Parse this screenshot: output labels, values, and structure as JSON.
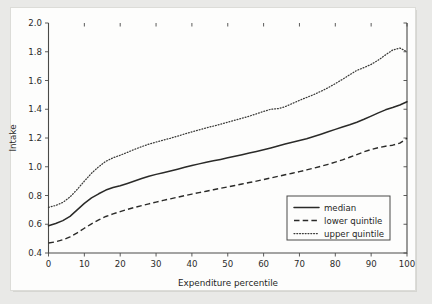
{
  "chart_data": {
    "type": "line",
    "title": "",
    "xlabel": "Expenditure percentile",
    "ylabel": "Intake",
    "xlim": [
      0,
      100
    ],
    "ylim": [
      0.4,
      2.0
    ],
    "grid": false,
    "legend_position": "bottom-right",
    "xticks": [
      "0",
      "10",
      "20",
      "30",
      "40",
      "50",
      "60",
      "70",
      "80",
      "90",
      "100"
    ],
    "xtick_values": [
      0,
      10,
      20,
      30,
      40,
      50,
      60,
      70,
      80,
      90,
      100
    ],
    "yticks": [
      "0.4",
      "0.6",
      "0.8",
      "1.0",
      "1.2",
      "1.4",
      "1.6",
      "1.8",
      "2.0"
    ],
    "ytick_values": [
      0.4,
      0.6,
      0.8,
      1.0,
      1.2,
      1.4,
      1.6,
      1.8,
      2.0
    ],
    "x": [
      0,
      2,
      4,
      6,
      8,
      10,
      12,
      14,
      16,
      18,
      20,
      22,
      24,
      26,
      28,
      30,
      32,
      34,
      36,
      38,
      40,
      42,
      44,
      46,
      48,
      50,
      52,
      54,
      56,
      58,
      60,
      62,
      64,
      66,
      68,
      70,
      72,
      74,
      76,
      78,
      80,
      82,
      84,
      86,
      88,
      90,
      92,
      94,
      96,
      98,
      100
    ],
    "series": [
      {
        "name": "median",
        "style": "solid",
        "values": [
          0.59,
          0.605,
          0.625,
          0.655,
          0.7,
          0.745,
          0.783,
          0.812,
          0.838,
          0.856,
          0.868,
          0.884,
          0.901,
          0.918,
          0.934,
          0.947,
          0.958,
          0.97,
          0.983,
          0.996,
          1.008,
          1.02,
          1.031,
          1.041,
          1.051,
          1.062,
          1.073,
          1.084,
          1.095,
          1.106,
          1.118,
          1.131,
          1.145,
          1.158,
          1.17,
          1.182,
          1.195,
          1.21,
          1.226,
          1.243,
          1.26,
          1.276,
          1.292,
          1.31,
          1.33,
          1.352,
          1.375,
          1.396,
          1.412,
          1.43,
          1.452
        ]
      },
      {
        "name": "lower quintile",
        "style": "dashed",
        "values": [
          0.47,
          0.478,
          0.492,
          0.512,
          0.54,
          0.572,
          0.603,
          0.63,
          0.654,
          0.672,
          0.688,
          0.703,
          0.717,
          0.73,
          0.742,
          0.754,
          0.766,
          0.777,
          0.788,
          0.799,
          0.81,
          0.82,
          0.83,
          0.84,
          0.85,
          0.86,
          0.87,
          0.88,
          0.89,
          0.9,
          0.911,
          0.922,
          0.933,
          0.944,
          0.955,
          0.966,
          0.978,
          0.99,
          1.003,
          1.017,
          1.032,
          1.048,
          1.066,
          1.085,
          1.104,
          1.12,
          1.133,
          1.143,
          1.15,
          1.164,
          1.198
        ]
      },
      {
        "name": "upper quintile",
        "style": "dotted",
        "values": [
          0.718,
          0.73,
          0.752,
          0.79,
          0.842,
          0.9,
          0.955,
          1.0,
          1.038,
          1.062,
          1.08,
          1.1,
          1.121,
          1.14,
          1.157,
          1.172,
          1.185,
          1.198,
          1.213,
          1.228,
          1.243,
          1.257,
          1.27,
          1.283,
          1.296,
          1.31,
          1.324,
          1.338,
          1.352,
          1.368,
          1.385,
          1.4,
          1.404,
          1.418,
          1.44,
          1.462,
          1.482,
          1.502,
          1.525,
          1.55,
          1.578,
          1.608,
          1.64,
          1.67,
          1.69,
          1.712,
          1.742,
          1.778,
          1.812,
          1.826,
          1.8
        ]
      }
    ]
  },
  "legend": {
    "items": [
      {
        "label": "median",
        "style": "solid"
      },
      {
        "label": "lower quintile",
        "style": "dashed"
      },
      {
        "label": "upper quintile",
        "style": "dotted"
      }
    ]
  }
}
